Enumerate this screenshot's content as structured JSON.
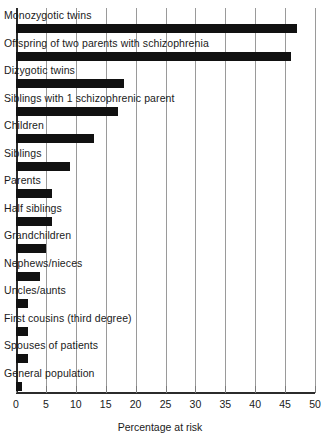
{
  "chart_data": {
    "type": "bar",
    "orientation": "horizontal",
    "title": "",
    "xlabel": "Percentage at risk",
    "ylabel": "",
    "xlim": [
      0,
      50
    ],
    "xticks": [
      0,
      5,
      10,
      15,
      20,
      25,
      30,
      35,
      40,
      45,
      50
    ],
    "xtick_labels": [
      "0",
      "5",
      "10",
      "15",
      "20",
      "25",
      "30",
      "35",
      "40",
      "45",
      "50"
    ],
    "grid": true,
    "grid_axis": "x",
    "legend": false,
    "bar_color": "#111111",
    "categories": [
      "Monozygotic twins",
      "Offspring of two parents with schizophrenia",
      "Dizygotic twins",
      "Siblings with 1 schizophrenic parent",
      "Children",
      "Siblings",
      "Parents",
      "Half siblings",
      "Grandchildren",
      "Nephews/nieces",
      "Uncles/aunts",
      "First cousins (third degree)",
      "Spouses of patients",
      "General population"
    ],
    "values": [
      47,
      46,
      18,
      17,
      13,
      9,
      6,
      6,
      5,
      4,
      2,
      2,
      2,
      1
    ]
  }
}
